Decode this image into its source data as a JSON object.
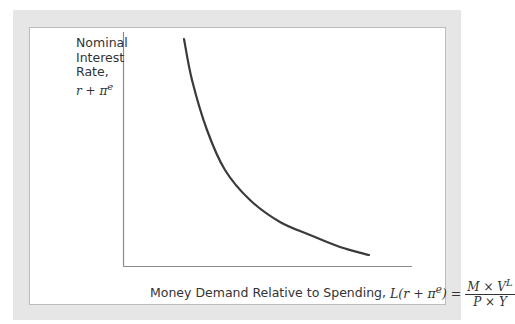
{
  "chart_data": {
    "type": "line",
    "title": "",
    "ylabel": "Nominal Interest Rate, r + πᵉ",
    "xlabel": "Money Demand Relative to Spending, L(r + πᵉ) = (M × Vᴸ)/(P × Y)",
    "grid": false,
    "legend": null,
    "axes_ticks": "none (qualitative diagram)",
    "series": [
      {
        "name": "Money demand curve",
        "description": "downward-sloping convex curve",
        "points_px": [
          [
            184,
            39
          ],
          [
            192,
            80
          ],
          [
            207,
            130
          ],
          [
            225,
            170
          ],
          [
            250,
            200
          ],
          [
            280,
            222
          ],
          [
            310,
            235
          ],
          [
            340,
            247
          ],
          [
            369,
            255
          ]
        ]
      }
    ]
  },
  "labels": {
    "y_line1": "Nominal",
    "y_line2": "Interest",
    "y_line3": "Rate,",
    "y_math": "r + π",
    "y_math_sup": "e",
    "x_text": "Money Demand Relative to Spending,",
    "x_math_lhs": "L(r + π",
    "x_math_sup": "e",
    "x_math_rhs": ") =",
    "x_frac_num": "M × V",
    "x_frac_num_sup": "L",
    "x_frac_den": "P × Y"
  },
  "colors": {
    "frame": "#e6e6e6",
    "axis": "#8a8a8a",
    "curve": "#3a3a3a"
  }
}
